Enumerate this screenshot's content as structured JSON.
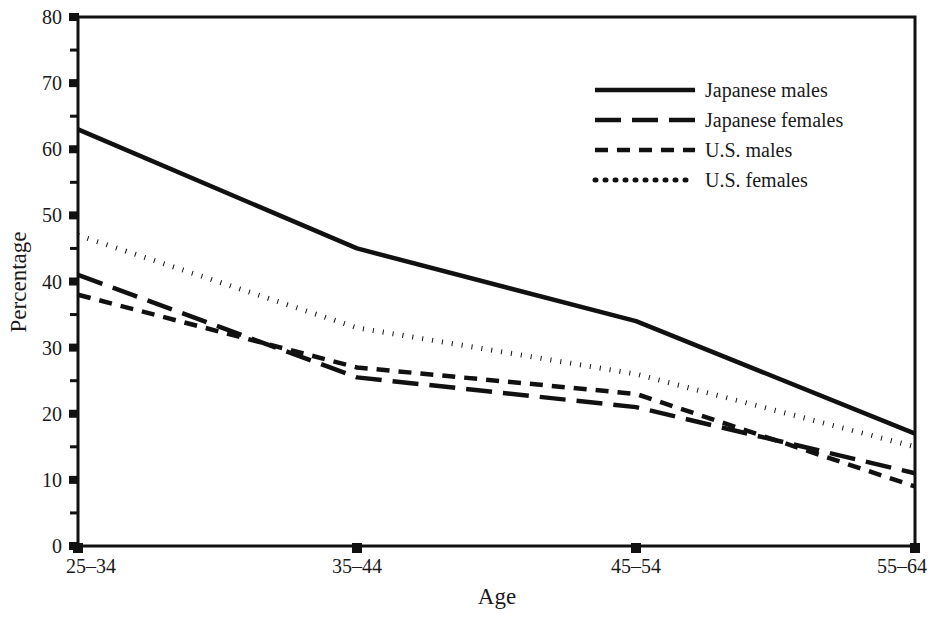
{
  "chart_data": {
    "type": "line",
    "title": "",
    "xlabel": "Age",
    "ylabel": "Percentage",
    "categories": [
      "25–34",
      "35–44",
      "45–54",
      "55–64"
    ],
    "x": [
      0,
      1,
      2,
      3
    ],
    "xlim": [
      0,
      3
    ],
    "ylim": [
      0,
      80
    ],
    "yticks": [
      0,
      10,
      20,
      30,
      40,
      50,
      60,
      70,
      80
    ],
    "ytick_labels": [
      "0",
      "10",
      "20",
      "30",
      "40",
      "50",
      "60",
      "70",
      "80"
    ],
    "yminor_ticks": [
      5,
      15,
      25,
      35,
      45,
      55,
      65,
      75
    ],
    "grid": false,
    "legend_position": "upper right",
    "series": [
      {
        "name": "Japanese males",
        "style": "solid",
        "color": "#111111",
        "values": [
          63,
          45,
          34,
          17
        ]
      },
      {
        "name": "Japanese females",
        "style": "long-dash",
        "color": "#111111",
        "values": [
          41,
          25.5,
          21,
          11
        ]
      },
      {
        "name": "U.S. males",
        "style": "short-dash",
        "color": "#111111",
        "values": [
          38,
          27,
          23,
          9
        ]
      },
      {
        "name": "U.S. females",
        "style": "dotted",
        "color": "#111111",
        "values": [
          47,
          33,
          26,
          15
        ]
      }
    ]
  },
  "axes": {
    "y_title": "Percentage",
    "x_title": "Age",
    "y_labels": [
      "80",
      "70",
      "60",
      "50",
      "40",
      "30",
      "20",
      "10",
      "0"
    ],
    "x_labels": [
      "25–34",
      "35–44",
      "45–54",
      "55–64"
    ]
  },
  "legend": {
    "entries": [
      {
        "label": "Japanese males",
        "style": "solid"
      },
      {
        "label": "Japanese females",
        "style": "long-dash"
      },
      {
        "label": "U.S. males",
        "style": "short-dash"
      },
      {
        "label": "U.S. females",
        "style": "dotted"
      }
    ]
  },
  "colors": {
    "ink": "#111111",
    "background": "#ffffff"
  }
}
